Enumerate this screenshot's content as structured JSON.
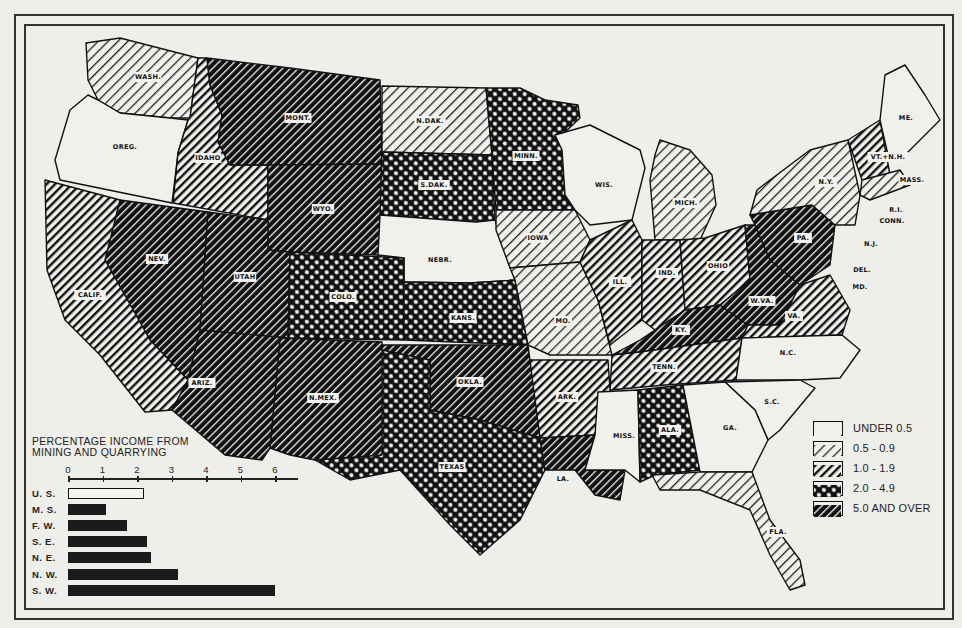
{
  "map": {
    "title": "PERCENTAGE INCOME FROM MINING AND QUARRYING",
    "longitude_ticks_top": [
      "125",
      "120",
      "115",
      "110",
      "105",
      "100",
      "95",
      "90",
      "85",
      "80",
      "75",
      "70"
    ],
    "longitude_ticks_bottom": [
      "115",
      "110",
      "105",
      "100",
      "95",
      "90",
      "85",
      "80",
      "75"
    ],
    "latitude_ticks": [
      "45",
      "40",
      "35",
      "30",
      "25"
    ],
    "patterns": {
      "under_0_5": "blank",
      "0_5_to_0_9": "light-hatch",
      "1_0_to_1_9": "medium-hatch",
      "2_0_to_4_9": "crosshatch",
      "5_0_and_over": "dark-hatch"
    },
    "states": [
      {
        "name": "WASH.",
        "class": "0_5_to_0_9",
        "label_xy": [
          148,
          77
        ],
        "points": "86,43 120,38 198,58 190,118 170,118 120,113 98,100 88,80"
      },
      {
        "name": "OREG.",
        "class": "under_0_5",
        "label_xy": [
          125,
          147
        ],
        "points": "88,95 98,100 120,113 170,118 188,120 178,153 172,203 60,180 55,160 70,110"
      },
      {
        "name": "IDAHO",
        "class": "1_0_to_1_9",
        "label_xy": [
          208,
          158
        ],
        "points": "198,58 207,58 210,85 222,115 218,142 230,165 268,165 268,220 173,203 178,153 188,120 190,118"
      },
      {
        "name": "MONT.",
        "class": "5_0_and_over",
        "label_xy": [
          298,
          118
        ],
        "points": "207,58 290,68 380,80 382,164 268,165 230,165 218,142 222,115 210,85"
      },
      {
        "name": "WYO.",
        "class": "5_0_and_over",
        "label_xy": [
          323,
          209
        ],
        "points": "268,165 382,164 380,255 290,252 268,250"
      },
      {
        "name": "N.DAK.",
        "class": "0_5_to_0_9",
        "label_xy": [
          430,
          121
        ],
        "points": "382,86 486,88 492,155 382,152"
      },
      {
        "name": "S.DAK.",
        "class": "2_0_to_4_9",
        "label_xy": [
          434,
          185
        ],
        "points": "382,152 492,155 495,220 476,222 380,215"
      },
      {
        "name": "MINN.",
        "class": "2_0_to_4_9",
        "label_xy": [
          526,
          156
        ],
        "points": "486,88 520,88 545,100 578,105 580,118 562,135 565,195 575,210 496,210 492,155"
      },
      {
        "name": "NEBR.",
        "class": "under_0_5",
        "label_xy": [
          440,
          260
        ],
        "points": "380,215 476,222 495,220 515,280 470,283 404,282 404,258 378,255"
      },
      {
        "name": "IOWA",
        "class": "0_5_to_0_9",
        "label_xy": [
          538,
          238
        ],
        "points": "496,210 575,210 590,240 580,262 510,268 496,230"
      },
      {
        "name": "WIS.",
        "class": "under_0_5",
        "label_xy": [
          604,
          185
        ],
        "points": "555,135 590,125 640,150 645,168 632,220 590,225 575,210 565,195 562,150"
      },
      {
        "name": "MICH.",
        "class": "0_5_to_0_9",
        "label_xy": [
          686,
          203
        ],
        "points": "660,140 690,150 712,175 716,205 700,240 655,240 650,180 655,155"
      },
      {
        "name": "NEV.",
        "class": "5_0_and_over",
        "label_xy": [
          157,
          259
        ],
        "points": "120,200 208,212 200,330 188,380 150,340 105,260"
      },
      {
        "name": "UTAH",
        "class": "5_0_and_over",
        "label_xy": [
          245,
          277
        ],
        "points": "208,212 268,220 268,250 290,252 288,338 200,330"
      },
      {
        "name": "CALIF.",
        "class": "1_0_to_1_9",
        "label_xy": [
          90,
          295
        ],
        "points": "45,180 120,200 105,260 150,340 188,380 172,410 145,412 100,355 65,320 47,270"
      },
      {
        "name": "COLO.",
        "class": "2_0_to_4_9",
        "label_xy": [
          343,
          297
        ],
        "points": "290,252 404,258 404,340 288,338"
      },
      {
        "name": "KANS.",
        "class": "2_0_to_4_9",
        "label_xy": [
          463,
          318
        ],
        "points": "404,282 470,283 515,280 528,345 404,340"
      },
      {
        "name": "MO.",
        "class": "0_5_to_0_9",
        "label_xy": [
          563,
          321
        ],
        "points": "510,268 580,262 598,300 612,355 550,355 528,345 515,280"
      },
      {
        "name": "ILL.",
        "class": "1_0_to_1_9",
        "label_xy": [
          620,
          282
        ],
        "points": "580,262 590,240 632,220 642,240 642,320 610,345 598,300"
      },
      {
        "name": "IND.",
        "class": "1_0_to_1_9",
        "label_xy": [
          667,
          273
        ],
        "points": "642,240 680,240 685,310 655,330 642,320"
      },
      {
        "name": "OHIO",
        "class": "1_0_to_1_9",
        "label_xy": [
          718,
          266
        ],
        "points": "680,240 705,238 745,225 750,280 720,305 685,310"
      },
      {
        "name": "KY.",
        "class": "5_0_and_over",
        "label_xy": [
          681,
          330
        ],
        "points": "612,355 640,340 685,310 720,305 748,325 742,338 640,352"
      },
      {
        "name": "W.VA.",
        "class": "5_0_and_over",
        "label_xy": [
          762,
          301
        ],
        "points": "745,225 755,225 770,260 800,285 780,325 748,325 720,305 750,280"
      },
      {
        "name": "PA.",
        "class": "5_0_and_over",
        "label_xy": [
          803,
          238
        ],
        "points": "750,215 812,205 835,225 830,265 800,285 770,260 755,225"
      },
      {
        "name": "N.Y.",
        "class": "0_5_to_0_9",
        "label_xy": [
          826,
          182
        ],
        "points": "757,190 810,150 848,140 860,195 855,225 835,225 812,205 750,215"
      },
      {
        "name": "VT.+N.H.",
        "class": "1_0_to_1_9",
        "label_xy": [
          888,
          157
        ],
        "points": "848,140 880,120 890,175 862,180"
      },
      {
        "name": "ME.",
        "class": "under_0_5",
        "label_xy": [
          906,
          118
        ],
        "points": "885,75 905,65 925,95 940,120 900,160 888,155 880,120"
      },
      {
        "name": "MASS.",
        "class": "0_5_to_0_9",
        "label_xy": [
          912,
          180
        ],
        "points": "862,180 900,170 910,185 870,200 860,195"
      },
      {
        "name": "VA.",
        "class": "1_0_to_1_9",
        "label_xy": [
          794,
          316
        ],
        "points": "780,325 800,285 830,275 850,310 842,335 742,338 748,325"
      },
      {
        "name": "TENN.",
        "class": "1_0_to_1_9",
        "label_xy": [
          664,
          367
        ],
        "points": "612,355 640,352 742,338 736,380 665,385 610,390"
      },
      {
        "name": "N.C.",
        "class": "under_0_5",
        "label_xy": [
          788,
          353
        ],
        "points": "742,338 842,335 860,350 840,378 800,380 736,380"
      },
      {
        "name": "S.C.",
        "class": "under_0_5",
        "label_xy": [
          772,
          402
        ],
        "points": "725,382 800,380 815,388 780,430 768,440 755,410"
      },
      {
        "name": "ARK.",
        "class": "1_0_to_1_9",
        "label_xy": [
          567,
          397
        ],
        "points": "528,360 608,360 610,390 595,435 540,438"
      },
      {
        "name": "OKLA.",
        "class": "5_0_and_over",
        "label_xy": [
          470,
          382
        ],
        "points": "380,345 528,345 540,438 480,420 430,410 430,360 382,360"
      },
      {
        "name": "TEXAS",
        "class": "2_0_to_4_9",
        "label_xy": [
          452,
          467
        ],
        "points": "382,350 430,360 430,410 480,420 540,438 545,470 520,520 480,555 450,525 400,470 350,480 315,460 375,455 380,370"
      },
      {
        "name": "N.MEX.",
        "class": "5_0_and_over",
        "label_xy": [
          323,
          398
        ],
        "points": "280,338 382,342 382,455 315,460 290,455 270,448"
      },
      {
        "name": "ARIZ.",
        "class": "5_0_and_over",
        "label_xy": [
          202,
          383
        ],
        "points": "200,330 288,338 280,338 270,448 262,460 225,455 172,410 188,380"
      },
      {
        "name": "LA.",
        "class": "5_0_and_over",
        "label_xy": [
          563,
          479
        ],
        "points": "540,438 595,435 585,470 625,470 620,500 595,495 575,470 545,470"
      },
      {
        "name": "MISS.",
        "class": "under_0_5",
        "label_xy": [
          624,
          436
        ],
        "points": "598,392 638,390 640,482 625,470 585,470 595,435"
      },
      {
        "name": "ALA.",
        "class": "2_0_to_4_9",
        "label_xy": [
          670,
          430
        ],
        "points": "638,390 683,385 700,470 655,475 640,482"
      },
      {
        "name": "GA.",
        "class": "under_0_5",
        "label_xy": [
          730,
          428
        ],
        "points": "683,385 725,382 755,410 768,440 752,472 700,472"
      },
      {
        "name": "FLA.",
        "class": "0_5_to_0_9",
        "label_xy": [
          778,
          532
        ],
        "points": "652,475 700,472 752,472 770,520 800,560 805,585 790,590 770,555 750,510 700,490 660,490"
      }
    ],
    "small_labels": [
      {
        "name": "R.I.",
        "xy": [
          896,
          210
        ]
      },
      {
        "name": "CONN.",
        "xy": [
          892,
          221
        ]
      },
      {
        "name": "N.J.",
        "xy": [
          871,
          244
        ]
      },
      {
        "name": "DEL.",
        "xy": [
          862,
          270
        ]
      },
      {
        "name": "MD.",
        "xy": [
          860,
          287
        ]
      }
    ]
  },
  "legend": {
    "items": [
      {
        "label": "UNDER 0.5",
        "class": "under_0_5"
      },
      {
        "label": "0.5 - 0.9",
        "class": "0_5_to_0_9"
      },
      {
        "label": "1.0 - 1.9",
        "class": "1_0_to_1_9"
      },
      {
        "label": "2.0 - 4.9",
        "class": "2_0_to_4_9"
      },
      {
        "label": "5.0 AND OVER",
        "class": "5_0_and_over"
      }
    ]
  },
  "chart_data": {
    "type": "bar",
    "orientation": "horizontal",
    "title": "PERCENTAGE INCOME FROM MINING AND QUARRYING",
    "title_lines": [
      "PERCENTAGE INCOME FROM",
      "MINING AND QUARRYING"
    ],
    "categories": [
      "U. S.",
      "M. S.",
      "F. W.",
      "S. E.",
      "N. E.",
      "N. W.",
      "S. W."
    ],
    "values": [
      2.2,
      1.1,
      1.7,
      2.3,
      2.4,
      3.2,
      6.0
    ],
    "highlight": {
      "U. S.": "outline"
    },
    "xlabel": "",
    "ylabel": "",
    "xticks": [
      "0",
      "1",
      "2",
      "3",
      "4",
      "5",
      "6"
    ],
    "xlim": [
      0,
      6.5
    ],
    "grid": false,
    "legend": null
  }
}
